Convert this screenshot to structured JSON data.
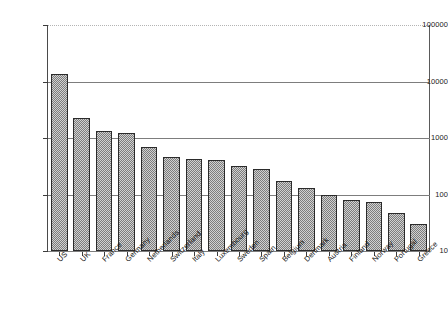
{
  "chart_data": {
    "type": "bar",
    "title": "",
    "subtitle": "",
    "xlabel": "",
    "ylabel": "",
    "scale": "log",
    "grid": true,
    "legend": null,
    "ylim": [
      10,
      100000
    ],
    "ytick_labels": [
      "100000",
      "10000",
      "1000",
      "100",
      "10"
    ],
    "ytick_values": [
      100000,
      10000,
      1000,
      100,
      10
    ],
    "categories": [
      "US",
      "UK",
      "France",
      "Germany",
      "Netherlands",
      "Switzerland",
      "Italy",
      "Luxembourg",
      "Sweden",
      "Spain",
      "Belgium",
      "Denmark",
      "Austria",
      "Finland",
      "Norway",
      "Portugal",
      "Greece"
    ],
    "values": [
      13800,
      2300,
      1350,
      1250,
      700,
      470,
      430,
      400,
      320,
      280,
      175,
      130,
      100,
      80,
      75,
      48,
      30
    ],
    "bar_fill_color": "#9a9a9a",
    "bar_edge_color": "#2b2b2b",
    "grid_color": "#7d7d7d",
    "axis_color": "#3c3c3c",
    "background_color": "#ffffff"
  }
}
